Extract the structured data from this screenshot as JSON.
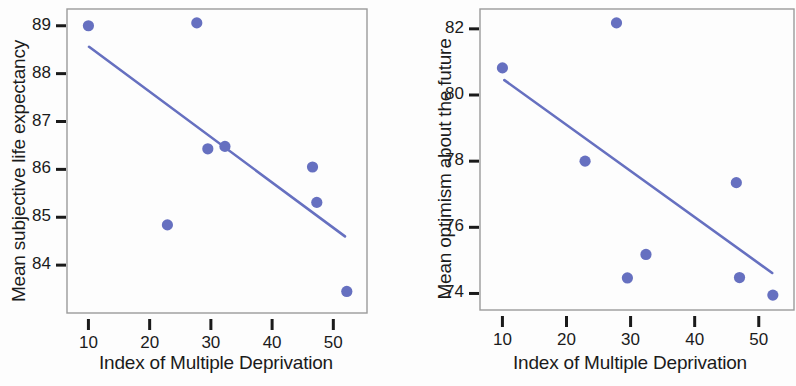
{
  "figure": {
    "background": "#fdfdfd",
    "point_color": "#6670c0",
    "line_color": "#6670c0",
    "frame_color": "#9a9a9a",
    "tick_color": "#1a1a1a",
    "text_color": "#1b1b1b"
  },
  "chart_data": [
    {
      "type": "scatter",
      "title": "",
      "xlabel": "Index of Multiple Deprivation",
      "ylabel": "Mean subjective life expectancy",
      "xlim": [
        6.5,
        55.5
      ],
      "ylim": [
        83.0,
        89.35
      ],
      "xticks": [
        10,
        20,
        30,
        40,
        50
      ],
      "yticks": [
        84,
        85,
        86,
        87,
        88,
        89
      ],
      "xtick_labels": [
        "10",
        "20",
        "30",
        "40",
        "50"
      ],
      "ytick_labels": [
        "84",
        "85",
        "86",
        "87",
        "88",
        "89"
      ],
      "grid": false,
      "legend": null,
      "x": [
        10.0,
        22.9,
        27.7,
        29.5,
        32.3,
        46.6,
        47.3,
        52.2
      ],
      "y": [
        89.0,
        84.84,
        89.06,
        86.43,
        86.48,
        86.05,
        85.31,
        83.45
      ],
      "series": [
        {
          "name": "Districts",
          "points": [
            {
              "x": 10.0,
              "y": 89.0
            },
            {
              "x": 22.9,
              "y": 84.84
            },
            {
              "x": 27.7,
              "y": 89.06
            },
            {
              "x": 29.5,
              "y": 86.43
            },
            {
              "x": 32.3,
              "y": 86.48
            },
            {
              "x": 46.6,
              "y": 86.05
            },
            {
              "x": 47.3,
              "y": 85.31
            },
            {
              "x": 52.2,
              "y": 83.45
            }
          ]
        }
      ],
      "trendline": {
        "x_start": 10.1,
        "y_start": 88.56,
        "x_end": 51.9,
        "y_end": 84.6
      }
    },
    {
      "type": "scatter",
      "title": "",
      "xlabel": "Index of Multiple Deprivation",
      "ylabel": "Mean optimism about the future",
      "xlim": [
        6.5,
        55.5
      ],
      "ylim": [
        73.5,
        82.6
      ],
      "xticks": [
        10,
        20,
        30,
        40,
        50
      ],
      "yticks": [
        74,
        76,
        78,
        80,
        82
      ],
      "xtick_labels": [
        "10",
        "20",
        "30",
        "40",
        "50"
      ],
      "ytick_labels": [
        "74",
        "76",
        "78",
        "80",
        "82"
      ],
      "grid": false,
      "legend": null,
      "x": [
        10.0,
        22.9,
        27.8,
        29.5,
        32.4,
        46.5,
        47.0,
        52.2
      ],
      "y": [
        80.82,
        78.0,
        82.18,
        74.47,
        75.18,
        77.35,
        74.48,
        73.95
      ],
      "series": [
        {
          "name": "Districts",
          "points": [
            {
              "x": 10.0,
              "y": 80.82
            },
            {
              "x": 22.9,
              "y": 78.0
            },
            {
              "x": 27.8,
              "y": 82.18
            },
            {
              "x": 29.5,
              "y": 74.47
            },
            {
              "x": 32.4,
              "y": 75.18
            },
            {
              "x": 46.5,
              "y": 77.35
            },
            {
              "x": 47.0,
              "y": 74.48
            },
            {
              "x": 52.2,
              "y": 73.95
            }
          ]
        }
      ],
      "trendline": {
        "x_start": 10.3,
        "y_start": 80.45,
        "x_end": 52.1,
        "y_end": 74.62
      }
    }
  ]
}
